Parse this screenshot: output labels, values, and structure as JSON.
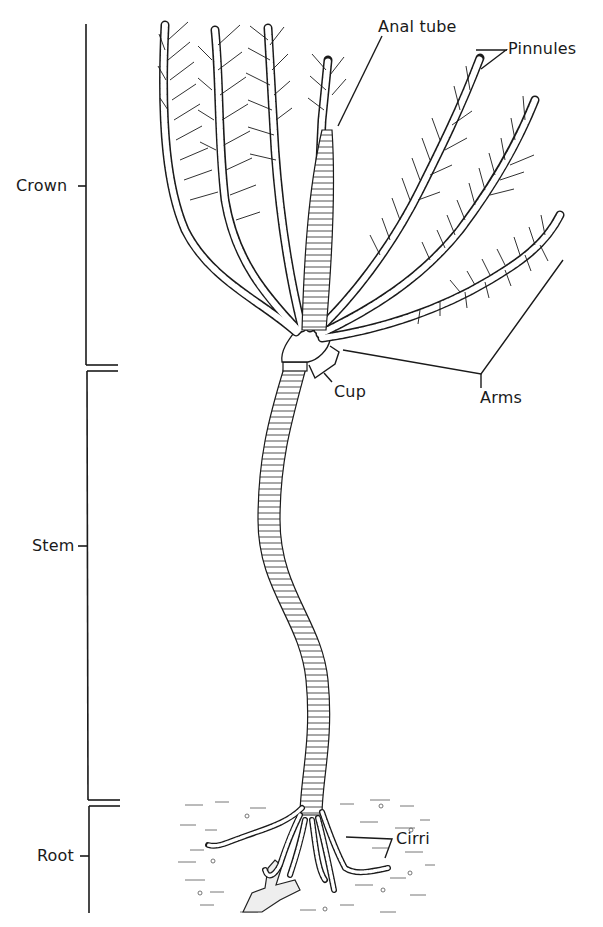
{
  "figure": {
    "background": "#ffffff",
    "ink_color": "#1a1a1a"
  },
  "region_labels": {
    "crown": "Crown",
    "stem": "Stem",
    "root": "Root"
  },
  "part_labels": {
    "anal_tube": "Anal tube",
    "pinnules": "Pinnules",
    "cup": "Cup",
    "arms": "Arms",
    "cirri": "Cirri"
  },
  "brackets": [
    {
      "region": "Crown",
      "top": 24,
      "bottom": 365,
      "label_y": 186
    },
    {
      "region": "Stem",
      "top": 371,
      "bottom": 800,
      "label_y": 546
    },
    {
      "region": "Root",
      "top": 806,
      "bottom": 913,
      "label_y": 856
    }
  ]
}
